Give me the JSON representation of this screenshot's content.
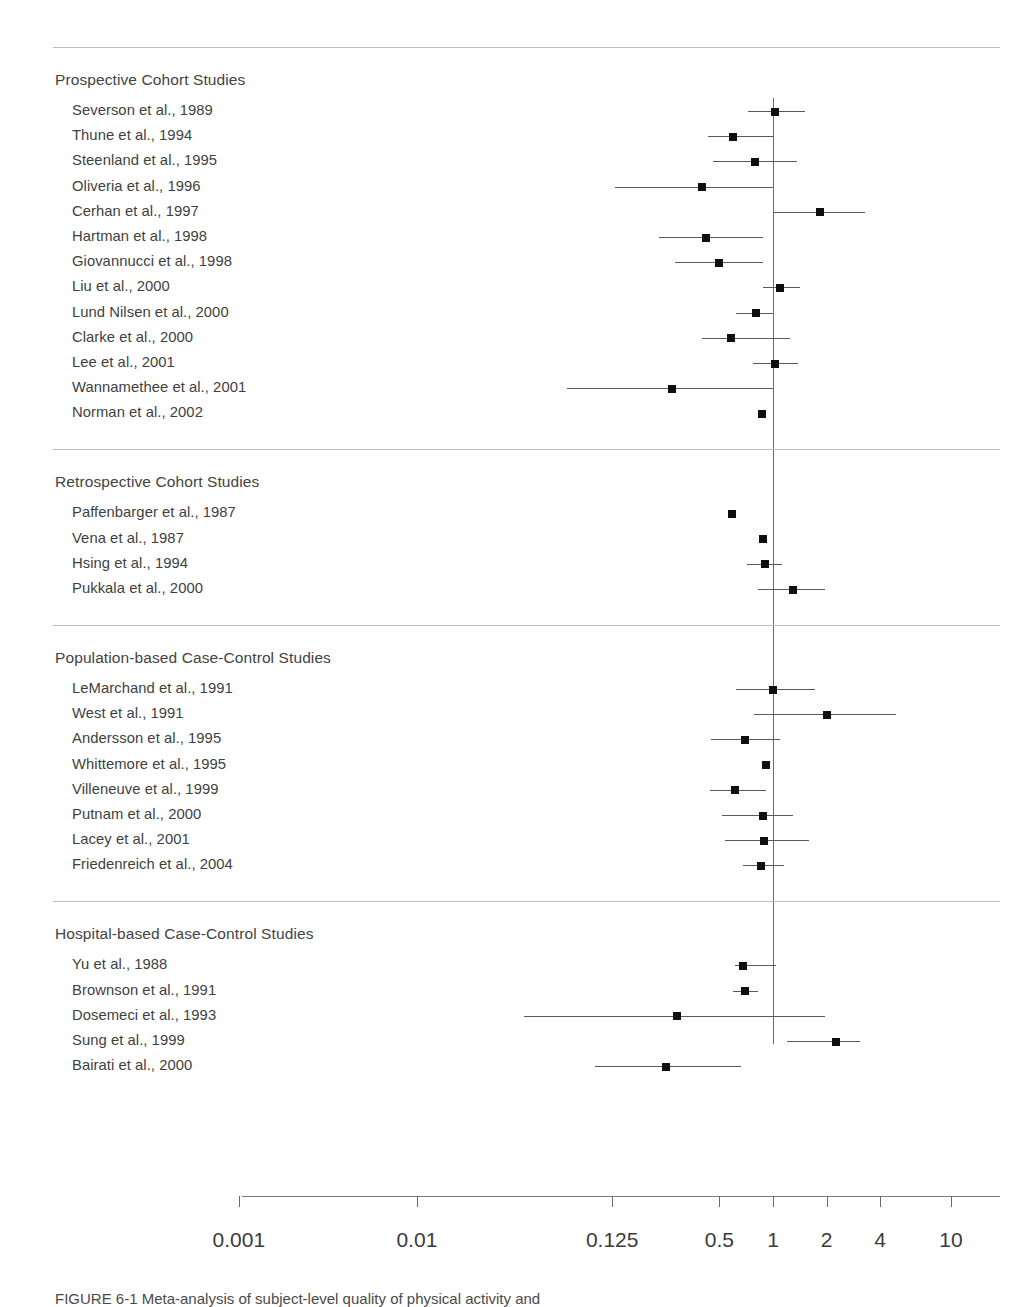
{
  "figure": {
    "type": "forest-plot",
    "null_value": 1,
    "caption": "FIGURE 6-1 Meta-analysis of subject-level quality of physical activity and",
    "axis": {
      "scale": "log",
      "ticks": [
        0.001,
        0.01,
        0.125,
        0.5,
        1,
        2,
        4,
        10
      ],
      "tick_labels": [
        "0.001",
        "0.01",
        "0.125",
        "0.5",
        "1",
        "2",
        "4",
        "10"
      ],
      "xlabel": ""
    }
  },
  "chart_data": {
    "type": "forest",
    "title": "",
    "xlabel": "",
    "ylabel": "",
    "xscale": "log",
    "xticks": [
      0.001,
      0.01,
      0.125,
      0.5,
      1,
      2,
      4,
      10
    ],
    "xtick_labels": [
      "0.001",
      "0.01",
      "0.125",
      "0.5",
      "1",
      "2",
      "4",
      "10"
    ],
    "reference_line": 1,
    "sections": [
      {
        "label": "Prospective Cohort Studies",
        "studies": [
          {
            "label": "Severson et al., 1989",
            "estimate": 1.03,
            "ci_low": 0.72,
            "ci_high": 1.52
          },
          {
            "label": "Thune et al., 1994",
            "estimate": 0.6,
            "ci_low": 0.43,
            "ci_high": 1.0
          },
          {
            "label": "Steenland et al., 1995",
            "estimate": 0.79,
            "ci_low": 0.46,
            "ci_high": 1.36
          },
          {
            "label": "Oliveria et al., 1996",
            "estimate": 0.4,
            "ci_low": 0.13,
            "ci_high": 1.0
          },
          {
            "label": "Cerhan et al., 1997",
            "estimate": 1.83,
            "ci_low": 1.0,
            "ci_high": 3.3
          },
          {
            "label": "Hartman et al., 1998",
            "estimate": 0.42,
            "ci_low": 0.23,
            "ci_high": 0.88
          },
          {
            "label": "Giovannucci et al., 1998",
            "estimate": 0.5,
            "ci_low": 0.28,
            "ci_high": 0.88
          },
          {
            "label": "Liu et al., 2000",
            "estimate": 1.1,
            "ci_low": 0.88,
            "ci_high": 1.42
          },
          {
            "label": "Lund Nilsen et al., 2000",
            "estimate": 0.8,
            "ci_low": 0.62,
            "ci_high": 1.0
          },
          {
            "label": "Clarke et al., 2000",
            "estimate": 0.58,
            "ci_low": 0.4,
            "ci_high": 1.25
          },
          {
            "label": "Lee et al., 2001",
            "estimate": 1.03,
            "ci_low": 0.77,
            "ci_high": 1.38
          },
          {
            "label": "Wannamethee et al., 2001",
            "estimate": 0.27,
            "ci_low": 0.07,
            "ci_high": 1.0
          },
          {
            "label": "Norman et al., 2002",
            "estimate": 0.87,
            "ci_low": null,
            "ci_high": null
          }
        ]
      },
      {
        "label": "Retrospective Cohort Studies",
        "studies": [
          {
            "label": "Paffenbarger et al., 1987",
            "estimate": 0.59,
            "ci_low": null,
            "ci_high": null
          },
          {
            "label": "Vena et al., 1987",
            "estimate": 0.88,
            "ci_low": null,
            "ci_high": null
          },
          {
            "label": "Hsing et al., 1994",
            "estimate": 0.9,
            "ci_low": 0.71,
            "ci_high": 1.12
          },
          {
            "label": "Pukkala et al., 2000",
            "estimate": 1.29,
            "ci_low": 0.82,
            "ci_high": 1.95
          }
        ]
      },
      {
        "label": "Population-based Case-Control Studies",
        "studies": [
          {
            "label": "LeMarchand et al., 1991",
            "estimate": 1.0,
            "ci_low": 0.62,
            "ci_high": 1.72
          },
          {
            "label": "West et al., 1991",
            "estimate": 2.0,
            "ci_low": 0.78,
            "ci_high": 4.92
          },
          {
            "label": "Andersson et al., 1995",
            "estimate": 0.7,
            "ci_low": 0.45,
            "ci_high": 1.1
          },
          {
            "label": "Whittemore et al., 1995",
            "estimate": 0.91,
            "ci_low": null,
            "ci_high": null
          },
          {
            "label": "Villeneuve et al., 1999",
            "estimate": 0.61,
            "ci_low": 0.44,
            "ci_high": 0.91
          },
          {
            "label": "Putnam et al., 2000",
            "estimate": 0.88,
            "ci_low": 0.52,
            "ci_high": 1.3
          },
          {
            "label": "Lacey et al., 2001",
            "estimate": 0.89,
            "ci_low": 0.54,
            "ci_high": 1.6
          },
          {
            "label": "Friedenreich et al., 2004",
            "estimate": 0.86,
            "ci_low": 0.68,
            "ci_high": 1.16
          }
        ]
      },
      {
        "label": "Hospital-based Case-Control Studies",
        "studies": [
          {
            "label": "Yu et al., 1988",
            "estimate": 0.68,
            "ci_low": 0.61,
            "ci_high": 1.04
          },
          {
            "label": "Brownson et al., 1991",
            "estimate": 0.7,
            "ci_low": 0.6,
            "ci_high": 0.82
          },
          {
            "label": "Dosemeci et al., 1993",
            "estimate": 0.29,
            "ci_low": 0.04,
            "ci_high": 1.95
          },
          {
            "label": "Sung et al., 1999",
            "estimate": 2.27,
            "ci_low": 1.2,
            "ci_high": 3.1
          },
          {
            "label": "Bairati et al., 2000",
            "estimate": 0.25,
            "ci_low": 0.1,
            "ci_high": 0.66
          }
        ]
      }
    ]
  }
}
